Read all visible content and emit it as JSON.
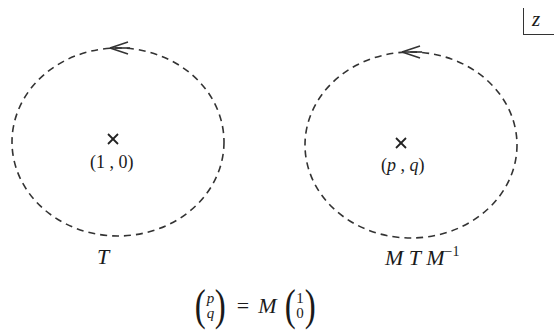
{
  "figure": {
    "corner_label": "z",
    "contours": [
      {
        "id": "left",
        "center_point": "(1 , 0)",
        "center_marker": "×",
        "name": "T",
        "orientation": "counterclockwise",
        "circle": {
          "cx": 118,
          "cy": 142,
          "rx": 106,
          "ry": 94
        }
      },
      {
        "id": "right",
        "center_point_parts": {
          "open": "(",
          "p": "p",
          "sep": " , ",
          "q": "q",
          "close": ")"
        },
        "center_marker": "×",
        "name_parts": {
          "m1": "M",
          "t": "T",
          "m2": "M",
          "exp": "−1"
        },
        "orientation": "counterclockwise",
        "circle": {
          "cx": 411,
          "cy": 145,
          "rx": 106,
          "ry": 93
        }
      }
    ],
    "equation": {
      "lhs": {
        "top": "p",
        "bottom": "q"
      },
      "equals": "=",
      "matrix": "M",
      "rhs": {
        "top": "1",
        "bottom": "0"
      }
    },
    "colors": {
      "stroke": "#333333",
      "text": "#1a1a1a"
    }
  }
}
